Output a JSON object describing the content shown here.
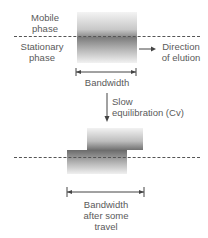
{
  "diagram": {
    "top": {
      "mobile_phase_label_1": "Mobile",
      "mobile_phase_label_2": "phase",
      "stationary_phase_label_1": "Stationary",
      "stationary_phase_label_2": "phase",
      "direction_label_1": "Direction",
      "direction_label_2": "of elution",
      "bandwidth_label": "Bandwidth"
    },
    "transition": {
      "label_1": "Slow",
      "label_2": "equilibration (Cv)"
    },
    "bottom": {
      "bandwidth_label_1": "Bandwidth",
      "bandwidth_label_2": "after some",
      "bandwidth_label_3": "travel"
    },
    "colors": {
      "band_dark": "#6e6e6e",
      "band_light": "#e6e6e6",
      "line": "#555555",
      "text": "#5a5a5a"
    }
  }
}
